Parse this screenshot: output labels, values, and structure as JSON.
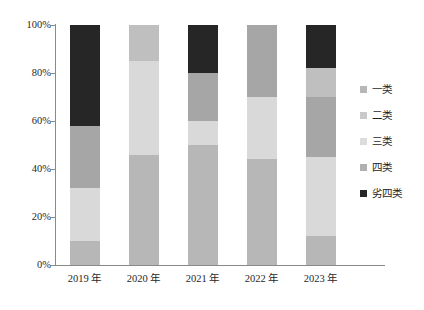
{
  "chart_data": {
    "type": "bar",
    "subtype": "stacked-percentage",
    "title": "",
    "subtitle": "",
    "xlabel": "",
    "ylabel": "",
    "categories": [
      "2019 年",
      "2020 年",
      "2021 年",
      "2022 年",
      "2023 年"
    ],
    "ylim": [
      0,
      100
    ],
    "ytick_labels": [
      "0%",
      "20%",
      "40%",
      "60%",
      "80%",
      "100%"
    ],
    "ytick_values": [
      0,
      20,
      40,
      60,
      80,
      100
    ],
    "grid": false,
    "legend_position": "right",
    "series": [
      {
        "name": "一类",
        "color": "#b7b7b7",
        "values": [
          10,
          46,
          50,
          44,
          12
        ]
      },
      {
        "name": "二类",
        "color": "#d9d9d9",
        "values": [
          22,
          39,
          10,
          26,
          33
        ]
      },
      {
        "name": "三类",
        "color": "#a6a6a6",
        "values": [
          26,
          0,
          20,
          30,
          25
        ]
      },
      {
        "name": "四类",
        "color": "#bfbfbf",
        "values": [
          0,
          15,
          0,
          0,
          12
        ]
      },
      {
        "name": "劣四类",
        "color": "#262626",
        "values": [
          42,
          0,
          20,
          0,
          18
        ]
      }
    ]
  },
  "axis": {
    "line_color": "#8a8a8a"
  },
  "legend": {
    "items": [
      {
        "label": "一类",
        "color": "#b7b7b7"
      },
      {
        "label": "二类",
        "color": "#c9c9c9"
      },
      {
        "label": "三类",
        "color": "#dcdcdc"
      },
      {
        "label": "四类",
        "color": "#b0b0b0"
      },
      {
        "label": "劣四类",
        "color": "#262626"
      }
    ]
  }
}
